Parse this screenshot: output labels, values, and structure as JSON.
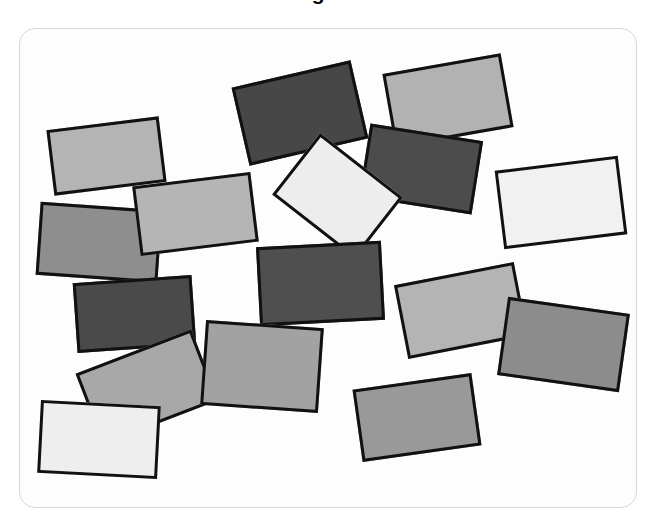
{
  "caption": {
    "fragment_text": "Figure"
  },
  "panel": {
    "name": "scatter-panel",
    "background_color": "#fdfdfd",
    "border_color": "#d9d9d9",
    "corner_radius_px": 16,
    "left_px": 19,
    "top_px": 28,
    "width_px": 618,
    "height_px": 480
  },
  "figure": {
    "outline_color": "#111111",
    "outline_width_px": 3,
    "canvas_background": "#ffffff",
    "shape_count": 16,
    "shape_kind": "rectangle"
  },
  "chart_data": {
    "type": "scatter",
    "title": "Figure",
    "xlabel": "",
    "ylabel": "",
    "xlim": [
      0,
      618
    ],
    "ylim": [
      0,
      480
    ],
    "grid": false,
    "legend": "none",
    "note": "Randomly placed and rotated filled rectangles with black outlines, varying gray fill values.",
    "series": [
      {
        "name": "rectangles",
        "marker": "rectangle",
        "values": [
          {
            "id": "rect-1",
            "x": 30,
            "y": 94,
            "w": 113,
            "h": 66,
            "rotation_deg": -7,
            "fill": "#b4b4b4",
            "tone": "light-gray"
          },
          {
            "id": "rect-2",
            "x": 219,
            "y": 44,
            "w": 122,
            "h": 80,
            "rotation_deg": -13,
            "fill": "#474747",
            "tone": "dark-gray"
          },
          {
            "id": "rect-3",
            "x": 368,
            "y": 34,
            "w": 120,
            "h": 75,
            "rotation_deg": -10,
            "fill": "#b2b2b2",
            "tone": "light-gray"
          },
          {
            "id": "rect-4",
            "x": 344,
            "y": 103,
            "w": 114,
            "h": 74,
            "rotation_deg": 9,
            "fill": "#4c4c4c",
            "tone": "dark-gray"
          },
          {
            "id": "rect-5",
            "x": 265,
            "y": 128,
            "w": 105,
            "h": 78,
            "rotation_deg": 38,
            "fill": "#ededed",
            "tone": "near-white"
          },
          {
            "id": "rect-6",
            "x": 479,
            "y": 134,
            "w": 124,
            "h": 79,
            "rotation_deg": -7,
            "fill": "#f1f1f1",
            "tone": "near-white"
          },
          {
            "id": "rect-7",
            "x": 18,
            "y": 177,
            "w": 122,
            "h": 73,
            "rotation_deg": 4,
            "fill": "#8e8e8e",
            "tone": "medium-gray"
          },
          {
            "id": "rect-8",
            "x": 116,
            "y": 150,
            "w": 119,
            "h": 70,
            "rotation_deg": -7,
            "fill": "#b5b5b5",
            "tone": "light-gray"
          },
          {
            "id": "rect-9",
            "x": 55,
            "y": 250,
            "w": 119,
            "h": 70,
            "rotation_deg": -4,
            "fill": "#4a4a4a",
            "tone": "dark-gray"
          },
          {
            "id": "rect-10",
            "x": 238,
            "y": 215,
            "w": 125,
            "h": 79,
            "rotation_deg": -3,
            "fill": "#4f4f4f",
            "tone": "dark-gray"
          },
          {
            "id": "rect-11",
            "x": 380,
            "y": 244,
            "w": 122,
            "h": 75,
            "rotation_deg": -11,
            "fill": "#b4b4b4",
            "tone": "light-gray"
          },
          {
            "id": "rect-12",
            "x": 482,
            "y": 276,
            "w": 123,
            "h": 79,
            "rotation_deg": 8,
            "fill": "#8c8c8c",
            "tone": "medium-gray"
          },
          {
            "id": "rect-13",
            "x": 65,
            "y": 320,
            "w": 124,
            "h": 76,
            "rotation_deg": -21,
            "fill": "#a8a8a8",
            "tone": "medium-gray"
          },
          {
            "id": "rect-14",
            "x": 183,
            "y": 295,
            "w": 118,
            "h": 85,
            "rotation_deg": 4,
            "fill": "#a2a2a2",
            "tone": "medium-gray"
          },
          {
            "id": "rect-15",
            "x": 19,
            "y": 374,
            "w": 120,
            "h": 73,
            "rotation_deg": 3,
            "fill": "#eeeeee",
            "tone": "near-white"
          },
          {
            "id": "rect-16",
            "x": 337,
            "y": 352,
            "w": 120,
            "h": 73,
            "rotation_deg": -8,
            "fill": "#999999",
            "tone": "medium-gray"
          }
        ]
      }
    ]
  }
}
